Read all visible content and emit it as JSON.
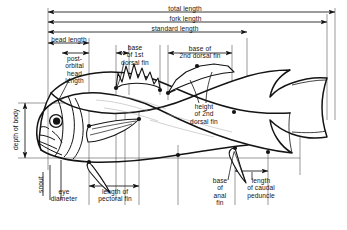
{
  "figure": {
    "species_outline": "generic perch-like fish, left-facing, with two dorsal fins, pectoral fin, anal fin and forked caudal fin"
  },
  "measurements": {
    "total_length": "total length",
    "fork_length": "fork length",
    "standard_length": "standard length",
    "head_length": "head length",
    "postorbital_head_length": "post-\norbital\nhead\nlength",
    "base_of_1st_dorsal_fin": "base\nof 1st\ndorsal fin",
    "base_of_2nd_dorsal_fin": "base of\n2nd dorsal fin",
    "height_of_2nd_dorsal_fin": "height\nof 2nd\ndorsal fin",
    "depth_of_body": "depth of body",
    "snout": "snout",
    "eye_diameter": "eye\ndiameter",
    "length_of_pectoral_fin": "length of\npectoral fin",
    "base_of_anal_fin": "base\nof\nanal\nfin",
    "length_of_caudal_peduncle": "length\nof caudal\npeduncle"
  },
  "colors": {
    "ink": "#141414",
    "rule": "#3c3c3c",
    "paper": "#ffffff",
    "fin_shade": "#6e6e6e"
  }
}
